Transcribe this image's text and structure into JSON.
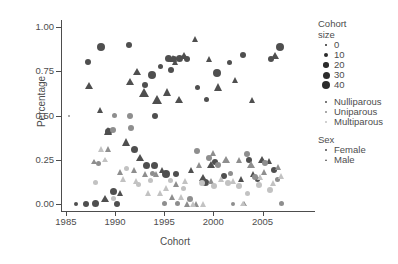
{
  "chart_data": {
    "type": "scatter",
    "title": "",
    "xlabel": "Cohort",
    "ylabel": "Percentage",
    "xlim": [
      1984.6,
      2007.6
    ],
    "ylim": [
      -0.04,
      1.04
    ],
    "xticks": [
      "1985",
      "1990",
      "1995",
      "2000",
      "2005"
    ],
    "xtickvals": [
      1985,
      1990,
      1995,
      2000,
      2005
    ],
    "yticks": [
      "0.00",
      "0.25",
      "0.50",
      "0.75",
      "1.00"
    ],
    "ytickvals": [
      0.0,
      0.25,
      0.5,
      0.75,
      1.0
    ],
    "grid": false,
    "legend_position": "right",
    "size_legend": {
      "title_line1": "Cohort",
      "title_line2": "size",
      "entries": [
        {
          "label": "0",
          "size": 2
        },
        {
          "label": "10",
          "size": 4
        },
        {
          "label": "20",
          "size": 5.5
        },
        {
          "label": "30",
          "size": 7
        },
        {
          "label": "40",
          "size": 8.5
        }
      ]
    },
    "parity_legend": {
      "title": "",
      "entries": [
        {
          "label": "Nulliparous",
          "color": "#4f4f4f"
        },
        {
          "label": "Uniparous",
          "color": "#8e8e8e"
        },
        {
          "label": "Multiparous",
          "color": "#c2c2c2"
        }
      ]
    },
    "sex_legend": {
      "title": "Sex",
      "entries": [
        {
          "label": "Female",
          "shape": "circle"
        },
        {
          "label": "Male",
          "shape": "triangle"
        }
      ]
    },
    "series": [
      {
        "name": "Nulliparous Female",
        "parity": "Nulliparous",
        "sex": "Female",
        "color": "#4f4f4f",
        "shape": "circle",
        "points": [
          {
            "x": 1986.0,
            "y": 0.0,
            "size": 4
          },
          {
            "x": 1987.0,
            "y": 0.0,
            "size": 6
          },
          {
            "x": 1988.0,
            "y": 0.0,
            "size": 7
          },
          {
            "x": 1987.2,
            "y": 0.8,
            "size": 6
          },
          {
            "x": 1988.6,
            "y": 0.89,
            "size": 8
          },
          {
            "x": 1989.3,
            "y": 0.41,
            "size": 7
          },
          {
            "x": 1989.8,
            "y": 0.07,
            "size": 7
          },
          {
            "x": 1990.2,
            "y": 0.0,
            "size": 6
          },
          {
            "x": 1991.4,
            "y": 0.9,
            "size": 6
          },
          {
            "x": 1993.0,
            "y": 0.67,
            "size": 6
          },
          {
            "x": 1993.8,
            "y": 0.73,
            "size": 8
          },
          {
            "x": 1994.1,
            "y": 0.5,
            "size": 6
          },
          {
            "x": 1995.4,
            "y": 0.82,
            "size": 7
          },
          {
            "x": 1996.0,
            "y": 0.82,
            "size": 6
          },
          {
            "x": 1996.6,
            "y": 0.82,
            "size": 7
          },
          {
            "x": 1997.3,
            "y": 0.82,
            "size": 6
          },
          {
            "x": 1995.7,
            "y": 0.76,
            "size": 6
          },
          {
            "x": 1994.6,
            "y": 0.78,
            "size": 5
          },
          {
            "x": 1992.0,
            "y": 0.31,
            "size": 7
          },
          {
            "x": 1993.2,
            "y": 0.22,
            "size": 7
          },
          {
            "x": 1994.0,
            "y": 0.22,
            "size": 7
          },
          {
            "x": 1995.2,
            "y": 0.17,
            "size": 8
          },
          {
            "x": 1996.2,
            "y": 0.17,
            "size": 6
          },
          {
            "x": 1998.4,
            "y": 0.66,
            "size": 5
          },
          {
            "x": 1999.3,
            "y": 0.59,
            "size": 5
          },
          {
            "x": 2000.4,
            "y": 0.74,
            "size": 8
          },
          {
            "x": 2001.6,
            "y": 0.8,
            "size": 5
          },
          {
            "x": 2003.0,
            "y": 0.84,
            "size": 6
          },
          {
            "x": 2006.8,
            "y": 0.89,
            "size": 8
          },
          {
            "x": 2005.9,
            "y": 0.82,
            "size": 6
          },
          {
            "x": 1999.2,
            "y": 0.12,
            "size": 7
          },
          {
            "x": 2000.2,
            "y": 0.24,
            "size": 6
          },
          {
            "x": 2001.1,
            "y": 0.16,
            "size": 6
          },
          {
            "x": 2003.6,
            "y": 0.25,
            "size": 6
          },
          {
            "x": 2004.5,
            "y": 0.14,
            "size": 5
          },
          {
            "x": 2006.2,
            "y": 0.19,
            "size": 6
          }
        ]
      },
      {
        "name": "Nulliparous Male",
        "parity": "Nulliparous",
        "sex": "Male",
        "color": "#4f4f4f",
        "shape": "triangle",
        "points": [
          {
            "x": 1987.4,
            "y": 0.67,
            "size": 7
          },
          {
            "x": 1988.5,
            "y": 0.53,
            "size": 6
          },
          {
            "x": 1989.4,
            "y": 0.41,
            "size": 8
          },
          {
            "x": 1989.0,
            "y": 0.03,
            "size": 7
          },
          {
            "x": 1991.6,
            "y": 0.69,
            "size": 7
          },
          {
            "x": 1993.0,
            "y": 0.63,
            "size": 9
          },
          {
            "x": 1992.3,
            "y": 0.75,
            "size": 7
          },
          {
            "x": 1994.3,
            "y": 0.59,
            "size": 9
          },
          {
            "x": 1995.4,
            "y": 0.63,
            "size": 8
          },
          {
            "x": 1996.5,
            "y": 0.59,
            "size": 7
          },
          {
            "x": 1995.9,
            "y": 0.82,
            "size": 7
          },
          {
            "x": 1996.2,
            "y": 0.8,
            "size": 6
          },
          {
            "x": 1997.0,
            "y": 0.84,
            "size": 7
          },
          {
            "x": 1991.2,
            "y": 0.35,
            "size": 8
          },
          {
            "x": 1992.6,
            "y": 0.26,
            "size": 7
          },
          {
            "x": 1990.6,
            "y": 0.06,
            "size": 6
          },
          {
            "x": 1994.8,
            "y": 0.19,
            "size": 6
          },
          {
            "x": 1997.8,
            "y": 0.19,
            "size": 6
          },
          {
            "x": 1999.0,
            "y": 0.15,
            "size": 7
          },
          {
            "x": 1999.8,
            "y": 0.22,
            "size": 7
          },
          {
            "x": 1998.2,
            "y": 0.93,
            "size": 6
          },
          {
            "x": 1999.6,
            "y": 0.82,
            "size": 6
          },
          {
            "x": 2000.6,
            "y": 0.66,
            "size": 8
          },
          {
            "x": 2002.3,
            "y": 0.7,
            "size": 6
          },
          {
            "x": 2004.0,
            "y": 0.59,
            "size": 6
          },
          {
            "x": 2006.3,
            "y": 0.84,
            "size": 7
          },
          {
            "x": 2005.0,
            "y": 0.25,
            "size": 7
          },
          {
            "x": 2005.7,
            "y": 0.24,
            "size": 6
          },
          {
            "x": 2002.9,
            "y": 0.14,
            "size": 6
          },
          {
            "x": 2004.1,
            "y": 0.17,
            "size": 6
          }
        ]
      },
      {
        "name": "Uniparous Female",
        "parity": "Uniparous",
        "sex": "Female",
        "color": "#8e8e8e",
        "shape": "circle",
        "points": [
          {
            "x": 1985.3,
            "y": 0.5,
            "size": 2
          },
          {
            "x": 1989.9,
            "y": 0.5,
            "size": 5
          },
          {
            "x": 1989.8,
            "y": 0.42,
            "size": 6
          },
          {
            "x": 1991.5,
            "y": 0.5,
            "size": 6
          },
          {
            "x": 1991.6,
            "y": 0.43,
            "size": 6
          },
          {
            "x": 1988.3,
            "y": 0.23,
            "size": 5
          },
          {
            "x": 1995.0,
            "y": 0.0,
            "size": 5
          },
          {
            "x": 1996.4,
            "y": 0.0,
            "size": 5
          },
          {
            "x": 1997.6,
            "y": 0.03,
            "size": 6
          },
          {
            "x": 1993.8,
            "y": 0.17,
            "size": 5
          },
          {
            "x": 1998.3,
            "y": 0.3,
            "size": 6
          },
          {
            "x": 1999.6,
            "y": 0.26,
            "size": 6
          },
          {
            "x": 2000.5,
            "y": 0.22,
            "size": 6
          },
          {
            "x": 2001.7,
            "y": 0.17,
            "size": 5
          },
          {
            "x": 2003.4,
            "y": 0.28,
            "size": 6
          },
          {
            "x": 2004.2,
            "y": 0.15,
            "size": 6
          },
          {
            "x": 2005.3,
            "y": 0.23,
            "size": 6
          },
          {
            "x": 2006.5,
            "y": 0.14,
            "size": 5
          },
          {
            "x": 2002.0,
            "y": 0.0,
            "size": 4
          },
          {
            "x": 2006.9,
            "y": 0.0,
            "size": 5
          }
        ]
      },
      {
        "name": "Uniparous Male",
        "parity": "Uniparous",
        "sex": "Male",
        "color": "#8e8e8e",
        "shape": "triangle",
        "points": [
          {
            "x": 1989.4,
            "y": 0.31,
            "size": 6
          },
          {
            "x": 1987.9,
            "y": 0.24,
            "size": 5
          },
          {
            "x": 1990.6,
            "y": 0.18,
            "size": 6
          },
          {
            "x": 1992.0,
            "y": 0.19,
            "size": 6
          },
          {
            "x": 1993.1,
            "y": 0.17,
            "size": 6
          },
          {
            "x": 1994.2,
            "y": 0.17,
            "size": 6
          },
          {
            "x": 1995.9,
            "y": 0.04,
            "size": 6
          },
          {
            "x": 1997.4,
            "y": 0.0,
            "size": 6
          },
          {
            "x": 1998.3,
            "y": 0.0,
            "size": 6
          },
          {
            "x": 1996.3,
            "y": 0.11,
            "size": 6
          },
          {
            "x": 1998.6,
            "y": 0.22,
            "size": 6
          },
          {
            "x": 2000.0,
            "y": 0.29,
            "size": 6
          },
          {
            "x": 2001.3,
            "y": 0.25,
            "size": 7
          },
          {
            "x": 2002.7,
            "y": 0.25,
            "size": 6
          },
          {
            "x": 2003.9,
            "y": 0.22,
            "size": 7
          },
          {
            "x": 2005.2,
            "y": 0.18,
            "size": 6
          },
          {
            "x": 2006.6,
            "y": 0.21,
            "size": 6
          },
          {
            "x": 2003.1,
            "y": 0.0,
            "size": 5
          },
          {
            "x": 1999.8,
            "y": 0.13,
            "size": 6
          }
        ]
      },
      {
        "name": "Multiparous Female",
        "parity": "Multiparous",
        "sex": "Female",
        "color": "#c2c2c2",
        "shape": "circle",
        "points": [
          {
            "x": 1989.8,
            "y": 0.03,
            "size": 5
          },
          {
            "x": 1991.2,
            "y": 0.2,
            "size": 5
          },
          {
            "x": 1992.4,
            "y": 0.11,
            "size": 5
          },
          {
            "x": 1993.6,
            "y": 0.13,
            "size": 5
          },
          {
            "x": 1995.6,
            "y": 0.13,
            "size": 5
          },
          {
            "x": 1997.0,
            "y": 0.09,
            "size": 5
          },
          {
            "x": 1998.8,
            "y": 0.12,
            "size": 6
          },
          {
            "x": 2000.1,
            "y": 0.1,
            "size": 6
          },
          {
            "x": 2001.5,
            "y": 0.12,
            "size": 6
          },
          {
            "x": 2002.6,
            "y": 0.1,
            "size": 6
          },
          {
            "x": 2004.6,
            "y": 0.11,
            "size": 6
          },
          {
            "x": 2005.8,
            "y": 0.08,
            "size": 6
          },
          {
            "x": 2003.5,
            "y": 0.06,
            "size": 5
          },
          {
            "x": 1988.0,
            "y": 0.12,
            "size": 5
          }
        ]
      },
      {
        "name": "Multiparous Male",
        "parity": "Multiparous",
        "sex": "Male",
        "color": "#c2c2c2",
        "shape": "triangle",
        "points": [
          {
            "x": 1988.6,
            "y": 0.31,
            "size": 6
          },
          {
            "x": 1989.0,
            "y": 0.25,
            "size": 5
          },
          {
            "x": 1990.9,
            "y": 0.14,
            "size": 6
          },
          {
            "x": 1992.2,
            "y": 0.13,
            "size": 6
          },
          {
            "x": 1993.4,
            "y": 0.06,
            "size": 6
          },
          {
            "x": 1994.6,
            "y": 0.06,
            "size": 6
          },
          {
            "x": 1996.8,
            "y": 0.04,
            "size": 6
          },
          {
            "x": 1998.0,
            "y": 0.0,
            "size": 6
          },
          {
            "x": 1999.0,
            "y": 0.0,
            "size": 6
          },
          {
            "x": 1997.2,
            "y": 0.13,
            "size": 6
          },
          {
            "x": 2000.8,
            "y": 0.14,
            "size": 6
          },
          {
            "x": 2002.1,
            "y": 0.13,
            "size": 6
          },
          {
            "x": 2004.8,
            "y": 0.15,
            "size": 6
          },
          {
            "x": 2006.1,
            "y": 0.12,
            "size": 6
          },
          {
            "x": 2007.0,
            "y": 0.16,
            "size": 6
          },
          {
            "x": 2003.0,
            "y": 0.0,
            "size": 5
          },
          {
            "x": 1995.3,
            "y": 0.09,
            "size": 6
          }
        ]
      }
    ]
  }
}
